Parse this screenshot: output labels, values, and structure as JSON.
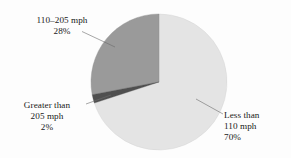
{
  "chart_data": {
    "type": "pie",
    "title": "",
    "subtitle": "",
    "xlabel": "",
    "ylabel": "",
    "legend_position": "none",
    "grid": false,
    "categories": [
      "Less than 110 mph",
      "110–205 mph",
      "Greater than 205 mph"
    ],
    "values": [
      70,
      28,
      2
    ],
    "unit": "%",
    "slices": [
      {
        "name": "less-than-110",
        "label_lines": [
          "Less than",
          "110 mph",
          "70%"
        ],
        "value": 70,
        "value_text": "70%",
        "color": "#e4e4e4",
        "start_angle_deg": 0,
        "end_angle_deg": 252
      },
      {
        "name": "110-to-205",
        "label_lines": [
          "110–205 mph",
          "28%"
        ],
        "value": 28,
        "value_text": "28%",
        "color": "#9a9a9a",
        "start_angle_deg": 259.2,
        "end_angle_deg": 360
      },
      {
        "name": "greater-than-205",
        "label_lines": [
          "Greater than",
          "205 mph",
          "2%"
        ],
        "value": 2,
        "value_text": "2%",
        "color": "#4f4f4f",
        "start_angle_deg": 252,
        "end_angle_deg": 259.2
      }
    ]
  },
  "labels": {
    "mid": {
      "line1": "110–205 mph",
      "line2": "28%"
    },
    "high": {
      "line1": "Greater than",
      "line2": "205 mph",
      "line3": "2%"
    },
    "low": {
      "line1": "Less than",
      "line2": "110 mph",
      "line3": "70%"
    }
  },
  "watermark": {
    "text": "746"
  },
  "colors": {
    "background": "#fdfdfd",
    "slice_light": "#e4e4e4",
    "slice_dark": "#9a9a9a",
    "slice_darkest": "#4f4f4f",
    "outline": "#c9c9c9",
    "leader": "#666666",
    "text": "#1a1a1a"
  }
}
